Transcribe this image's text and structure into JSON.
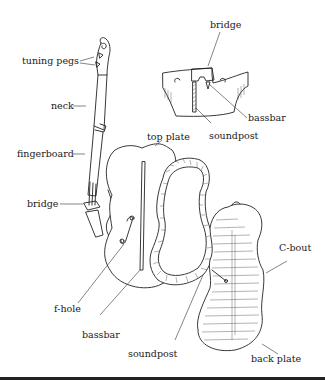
{
  "diagram": {
    "type": "labeled-illustration",
    "labels": {
      "tuning_pegs": "tuning pegs",
      "neck": "neck",
      "fingerboard": "fingerboard",
      "bridge_side": "bridge",
      "bridge_detail": "bridge",
      "bassbar_detail": "bassbar",
      "soundpost_detail": "soundpost",
      "top_plate": "top plate",
      "c_bout": "C-bout",
      "f_hole": "f-hole",
      "bassbar_main": "bassbar",
      "soundpost_main": "soundpost",
      "back_plate": "back plate"
    },
    "parts": [
      {
        "id": "side-view-violin",
        "labels": [
          "tuning pegs",
          "neck",
          "fingerboard",
          "bridge"
        ]
      },
      {
        "id": "bridge-cross-section",
        "labels": [
          "bridge",
          "bassbar",
          "soundpost"
        ]
      },
      {
        "id": "top-plate",
        "labels": [
          "top plate",
          "f-hole",
          "bassbar"
        ]
      },
      {
        "id": "ribs",
        "labels": [
          "soundpost"
        ]
      },
      {
        "id": "back-plate",
        "labels": [
          "C-bout",
          "back plate"
        ]
      }
    ],
    "colors": {
      "ink": "#222222",
      "background": "#ffffff"
    }
  }
}
